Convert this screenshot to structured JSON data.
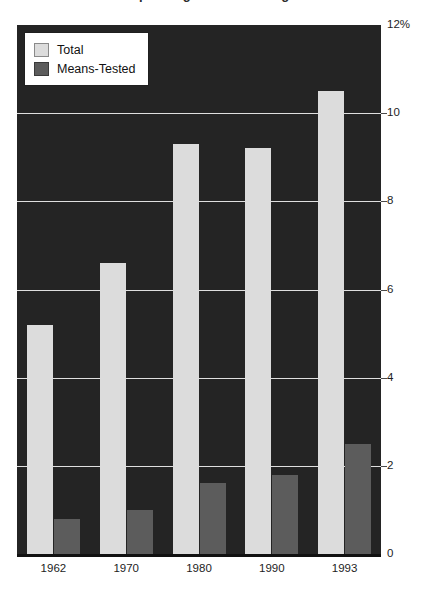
{
  "chart": {
    "title": "Welfare Spending as a Percentage of GDP"
  },
  "legend": {
    "position": "top-left",
    "items": [
      {
        "label": "Total",
        "color": "#dcdcdc",
        "swatch": "legend-swatch-total"
      },
      {
        "label": "Means-Tested",
        "color": "#5c5c5c",
        "swatch": "legend-swatch-means"
      }
    ]
  },
  "axes": {
    "y_ticks": [
      "12%",
      "10",
      "8",
      "6",
      "4",
      "2",
      "0"
    ],
    "y_values": [
      12,
      10,
      8,
      6,
      4,
      2,
      0
    ],
    "x_ticks": [
      "1962",
      "1970",
      "1980",
      "1990",
      "1993"
    ]
  },
  "chart_data": {
    "type": "bar",
    "title": "Welfare Spending as a Percentage of GDP",
    "xlabel": "",
    "ylabel": "",
    "ylim": [
      0,
      12
    ],
    "yticks": [
      0,
      2,
      4,
      6,
      8,
      10,
      12
    ],
    "ytick_labels": [
      "0",
      "2",
      "4",
      "6",
      "8",
      "10",
      "12%"
    ],
    "grid": true,
    "legend_position": "top-left",
    "categories": [
      "1962",
      "1970",
      "1980",
      "1990",
      "1993"
    ],
    "series": [
      {
        "name": "Total",
        "color": "#dcdcdc",
        "values": [
          5.2,
          6.6,
          9.3,
          9.2,
          10.5
        ]
      },
      {
        "name": "Means-Tested",
        "color": "#5c5c5c",
        "values": [
          0.8,
          1.0,
          1.6,
          1.8,
          2.5
        ]
      }
    ]
  },
  "colors": {
    "plot_background": "#242424",
    "page_background": "#ffffff",
    "gridline": "#f0f0f0",
    "total_bar": "#dcdcdc",
    "means_bar": "#5c5c5c",
    "text": "#1d1d1d"
  }
}
